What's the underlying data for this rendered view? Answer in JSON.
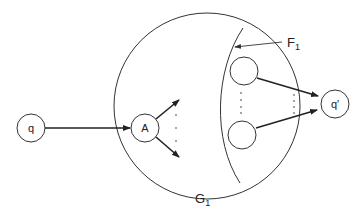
{
  "diagram": {
    "nodes": {
      "q": {
        "label": "q"
      },
      "A": {
        "label": "A"
      },
      "q_prime": {
        "label": "q′"
      },
      "inner_top": {
        "label": ""
      },
      "inner_bottom": {
        "label": ""
      }
    },
    "regions": {
      "G1": {
        "label": "G",
        "subscript": "1"
      },
      "F1": {
        "label": "F",
        "subscript": "1"
      }
    },
    "colors": {
      "stroke": "#333333",
      "background": "#ffffff"
    }
  }
}
